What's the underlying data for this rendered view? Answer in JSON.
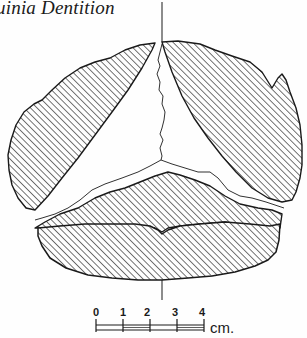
{
  "page": {
    "running_title": "uinia Dentition"
  },
  "figure": {
    "regions": [
      {
        "name": "upper-left-hatched-region",
        "fill": "hatched"
      },
      {
        "name": "upper-right-hatched-region",
        "fill": "hatched"
      },
      {
        "name": "middle-hatched-region",
        "fill": "hatched"
      },
      {
        "name": "lower-hatched-region",
        "fill": "hatched"
      },
      {
        "name": "central-unhatched-region",
        "fill": "blank"
      }
    ],
    "ink_color": "#1a1a1a",
    "paper_color": "#fefefe"
  },
  "scale_bar": {
    "ticks": [
      "0",
      "1",
      "2",
      "3",
      "4"
    ],
    "unit": "cm."
  }
}
